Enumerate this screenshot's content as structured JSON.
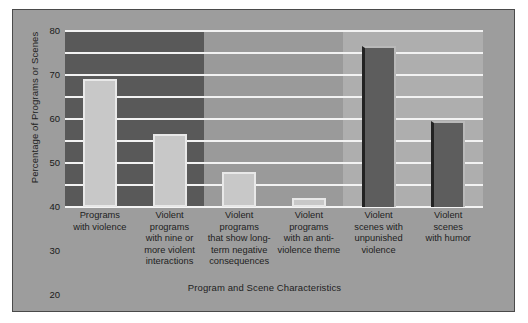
{
  "chart_data": {
    "type": "bar",
    "title": "",
    "xlabel": "Program and Scene Characteristics",
    "ylabel": "Percentage of Programs or Scenes",
    "ylim": [
      0,
      80
    ],
    "yticks": [
      0,
      10,
      20,
      30,
      40,
      50,
      60,
      70,
      80
    ],
    "grid": "horizontal",
    "legend": "none",
    "categories": [
      "Programs with violence",
      "Violent programs with nine or more violent interactions",
      "Violent programs that show long-term negative consequences",
      "Violent programs with an anti-violence theme",
      "Violent scenes with unpunished violence",
      "Violent scenes with humor"
    ],
    "category_lines": [
      [
        "Programs",
        "with violence"
      ],
      [
        "Violent",
        "programs",
        "with nine or",
        "more violent",
        "interactions"
      ],
      [
        "Violent",
        "programs",
        "that show long-",
        "term negative",
        "consequences"
      ],
      [
        "Violent",
        "programs",
        "with an anti-",
        "violence theme"
      ],
      [
        "Violent",
        "scenes with",
        "unpunished",
        "violence"
      ],
      [
        "Violent",
        "scenes",
        "with humor"
      ]
    ],
    "values": [
      58,
      33,
      16,
      4,
      73,
      39
    ],
    "bar_styles": [
      "light",
      "light",
      "light",
      "light",
      "dark",
      "dark"
    ],
    "background_bands": [
      {
        "name": "dark-band",
        "style": "dark",
        "start_pct": 0,
        "end_pct": 33.3
      },
      {
        "name": "mid-band",
        "style": "mid",
        "start_pct": 33.3,
        "end_pct": 66.6
      },
      {
        "name": "light-band",
        "style": "light",
        "start_pct": 66.6,
        "end_pct": 100
      }
    ]
  },
  "colors": {
    "page_background": "#ffffff",
    "panel_background": "#9d9d9d",
    "panel_border": "#4a4a4a",
    "plot_background": "#9a9a9a",
    "band_dark": "#595959",
    "band_light": "#aeaeae",
    "gridline": "#f2f2f2",
    "bar_light_fill": "#c8c8c8",
    "bar_light_edge": "#e8e8e8",
    "bar_dark_fill": "#5d5d5d",
    "bar_dark_edge": "#b9b9b9",
    "bar_dark_shadow": "#222222",
    "text": "#1d1d1d"
  }
}
